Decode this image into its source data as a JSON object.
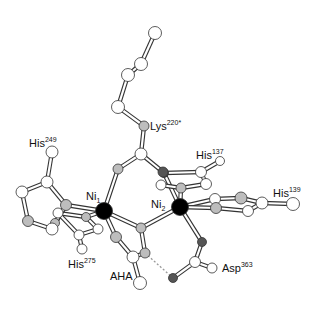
{
  "figure": {
    "colors": {
      "nickel": "#000000",
      "oxygen_dark": "#555555",
      "nitrogen_gray": "#bdbdbd",
      "carbon_white": "#ffffff",
      "outline": "#333333",
      "hbond": "#999999"
    },
    "labels": {
      "lys": {
        "base": "Lys",
        "sup": "220*"
      },
      "his249": {
        "base": "His",
        "sup": "249"
      },
      "his137": {
        "base": "His",
        "sup": "137"
      },
      "his139": {
        "base": "His",
        "sup": "139"
      },
      "his275": {
        "base": "His",
        "sup": "275"
      },
      "ni1": {
        "base": "Ni",
        "sub": "1"
      },
      "ni2": {
        "base": "Ni",
        "sub": "2"
      },
      "aha": {
        "base": "AHA"
      },
      "asp363": {
        "base": "Asp",
        "sup": "363"
      }
    },
    "atoms": [
      {
        "id": "k1",
        "x": 155,
        "y": 33,
        "r": 6.5,
        "type": "C"
      },
      {
        "id": "k2",
        "x": 141,
        "y": 64,
        "r": 6.5,
        "type": "C"
      },
      {
        "id": "k3",
        "x": 128,
        "y": 75,
        "r": 6.5,
        "type": "C"
      },
      {
        "id": "k4",
        "x": 118,
        "y": 107,
        "r": 6.5,
        "type": "C"
      },
      {
        "id": "kN",
        "x": 144,
        "y": 126,
        "r": 5,
        "type": "N"
      },
      {
        "id": "kC",
        "x": 141,
        "y": 154,
        "r": 6,
        "type": "C"
      },
      {
        "id": "bO1",
        "x": 118,
        "y": 169,
        "r": 5,
        "type": "N"
      },
      {
        "id": "bO2",
        "x": 163,
        "y": 172,
        "r": 5,
        "type": "O"
      },
      {
        "id": "ni1",
        "x": 104,
        "y": 211,
        "r": 8.5,
        "type": "Ni"
      },
      {
        "id": "ni2",
        "x": 180,
        "y": 207,
        "r": 8.5,
        "type": "Ni"
      },
      {
        "id": "h249a",
        "x": 52,
        "y": 152,
        "r": 6,
        "type": "C"
      },
      {
        "id": "h249b",
        "x": 47,
        "y": 182,
        "r": 6,
        "type": "C"
      },
      {
        "id": "h249c",
        "x": 22,
        "y": 192,
        "r": 6,
        "type": "C"
      },
      {
        "id": "h249d",
        "x": 28,
        "y": 221,
        "r": 5.5,
        "type": "N"
      },
      {
        "id": "h249e",
        "x": 52,
        "y": 229,
        "r": 6,
        "type": "C"
      },
      {
        "id": "h249f",
        "x": 66,
        "y": 205,
        "r": 5.5,
        "type": "N"
      },
      {
        "id": "h275a",
        "x": 58,
        "y": 213,
        "r": 5,
        "type": "C"
      },
      {
        "id": "h275b",
        "x": 86,
        "y": 217,
        "r": 4.5,
        "type": "N"
      },
      {
        "id": "h275c",
        "x": 98,
        "y": 229,
        "r": 5,
        "type": "C"
      },
      {
        "id": "h275d",
        "x": 79,
        "y": 235,
        "r": 5,
        "type": "C"
      },
      {
        "id": "h275e",
        "x": 82,
        "y": 249,
        "r": 5,
        "type": "C"
      },
      {
        "id": "h275f",
        "x": 55,
        "y": 223,
        "r": 4.5,
        "type": "N"
      },
      {
        "id": "bC",
        "x": 141,
        "y": 228,
        "r": 5,
        "type": "N"
      },
      {
        "id": "ahaO",
        "x": 116,
        "y": 237,
        "r": 5.5,
        "type": "N"
      },
      {
        "id": "ahaC",
        "x": 133,
        "y": 257,
        "r": 6,
        "type": "C"
      },
      {
        "id": "ahaN",
        "x": 145,
        "y": 253,
        "r": 5,
        "type": "N"
      },
      {
        "id": "ahaC2",
        "x": 140,
        "y": 283,
        "r": 6.5,
        "type": "C"
      },
      {
        "id": "h137a",
        "x": 164,
        "y": 173,
        "r": 4.5,
        "type": "O"
      },
      {
        "id": "h137b",
        "x": 201,
        "y": 172,
        "r": 5.5,
        "type": "C"
      },
      {
        "id": "h137c",
        "x": 220,
        "y": 161,
        "r": 4.5,
        "type": "C"
      },
      {
        "id": "h137d",
        "x": 206,
        "y": 184,
        "r": 5.5,
        "type": "C"
      },
      {
        "id": "h137e",
        "x": 181,
        "y": 188,
        "r": 5,
        "type": "N"
      },
      {
        "id": "h137f",
        "x": 161,
        "y": 185,
        "r": 5,
        "type": "C"
      },
      {
        "id": "h139a",
        "x": 215,
        "y": 199,
        "r": 5.5,
        "type": "C"
      },
      {
        "id": "h139b",
        "x": 216,
        "y": 208,
        "r": 5.5,
        "type": "N"
      },
      {
        "id": "h139c",
        "x": 241,
        "y": 198,
        "r": 6,
        "type": "N"
      },
      {
        "id": "h139d",
        "x": 248,
        "y": 211,
        "r": 5.5,
        "type": "C"
      },
      {
        "id": "h139e",
        "x": 262,
        "y": 203,
        "r": 6,
        "type": "C"
      },
      {
        "id": "h139f",
        "x": 293,
        "y": 204,
        "r": 6.5,
        "type": "C"
      },
      {
        "id": "aspO1",
        "x": 202,
        "y": 242,
        "r": 4.5,
        "type": "O"
      },
      {
        "id": "aspC",
        "x": 195,
        "y": 262,
        "r": 5.5,
        "type": "C"
      },
      {
        "id": "aspO2",
        "x": 212,
        "y": 268,
        "r": 5,
        "type": "C"
      },
      {
        "id": "aspO3",
        "x": 173,
        "y": 278,
        "r": 4.5,
        "type": "O"
      }
    ],
    "bonds": [
      [
        "k1",
        "k2"
      ],
      [
        "k2",
        "k3"
      ],
      [
        "k3",
        "k4"
      ],
      [
        "k4",
        "kN"
      ],
      [
        "kN",
        "kC"
      ],
      [
        "kC",
        "bO1"
      ],
      [
        "kC",
        "bO2"
      ],
      [
        "bO1",
        "ni1"
      ],
      [
        "bO2",
        "h137a"
      ],
      [
        "h249a",
        "h249b"
      ],
      [
        "h249b",
        "h249c"
      ],
      [
        "h249c",
        "h249d"
      ],
      [
        "h249d",
        "h249e"
      ],
      [
        "h249e",
        "h249f"
      ],
      [
        "h249b",
        "h249f"
      ],
      [
        "h249f",
        "ni1"
      ],
      [
        "h275a",
        "h275b"
      ],
      [
        "h275b",
        "ni1"
      ],
      [
        "h275b",
        "h275c"
      ],
      [
        "h275c",
        "h275d"
      ],
      [
        "h275d",
        "h275a"
      ],
      [
        "h275d",
        "h275e"
      ],
      [
        "h275f",
        "h249f"
      ],
      [
        "ni1",
        "bC"
      ],
      [
        "bC",
        "ni2"
      ],
      [
        "bC",
        "ahaN"
      ],
      [
        "ni1",
        "ahaO"
      ],
      [
        "ahaO",
        "ahaC"
      ],
      [
        "ahaC",
        "ahaN"
      ],
      [
        "ahaC",
        "ahaC2"
      ],
      [
        "h137a",
        "ni2"
      ],
      [
        "h137a",
        "h137b"
      ],
      [
        "h137b",
        "h137c"
      ],
      [
        "h137b",
        "h137d"
      ],
      [
        "h137d",
        "h137e"
      ],
      [
        "h137e",
        "h137f"
      ],
      [
        "h137e",
        "ni2"
      ],
      [
        "ni2",
        "h139a"
      ],
      [
        "ni2",
        "h139b"
      ],
      [
        "h139a",
        "h139c"
      ],
      [
        "h139b",
        "h139d"
      ],
      [
        "h139c",
        "h139e"
      ],
      [
        "h139d",
        "h139e"
      ],
      [
        "h139e",
        "h139f"
      ],
      [
        "ni2",
        "aspO1"
      ],
      [
        "aspO1",
        "aspC"
      ],
      [
        "aspC",
        "aspO2"
      ],
      [
        "aspC",
        "aspO3"
      ]
    ],
    "hbonds": [
      [
        "ahaN",
        "aspO3"
      ]
    ]
  }
}
